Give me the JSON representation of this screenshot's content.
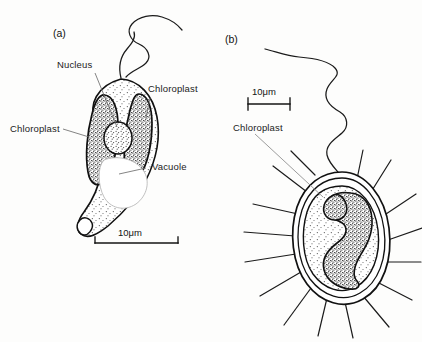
{
  "figure": {
    "background_color": "#fdfdfc",
    "ink_color": "#1b1b1b"
  },
  "panels": [
    {
      "id": "a",
      "label": "(a)",
      "description": "teardrop-shaped biflagellate cell with two lateral chloroplasts, central nucleus and vacuole",
      "labels": [
        {
          "name": "nucleus",
          "text": "Nucleus"
        },
        {
          "name": "chloroplast-right",
          "text": "Chloroplast"
        },
        {
          "name": "chloroplast-left",
          "text": "Chloroplast"
        },
        {
          "name": "vacuole",
          "text": "Vacuole"
        }
      ],
      "scale_bar": {
        "text": "10μm",
        "length_px": 83
      }
    },
    {
      "id": "b",
      "label": "(b)",
      "description": "ovoid cell enclosed in a double lorica wall with radiating spines, a single long flagellum and an S-shaped chloroplast",
      "labels": [
        {
          "name": "chloroplast",
          "text": "Chloroplast"
        }
      ],
      "scale_bar": {
        "text": "10μm",
        "length_px": 42
      }
    }
  ]
}
